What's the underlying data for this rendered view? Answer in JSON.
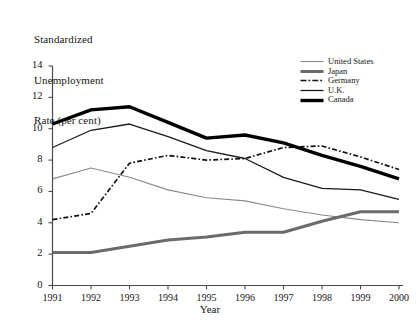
{
  "chart_data": {
    "type": "line",
    "title": "Standardized Unemployment Rate (per cent)",
    "title_lines": [
      "Standardized",
      "Unemployment",
      "Rate (per cent)"
    ],
    "xlabel": "Year",
    "ylabel": "Standardized Unemployment Rate (per cent)",
    "x": [
      1991,
      1992,
      1993,
      1994,
      1995,
      1996,
      1997,
      1998,
      1999,
      2000
    ],
    "categories": [
      "1991",
      "1992",
      "1993",
      "1994",
      "1995",
      "1996",
      "1997",
      "1998",
      "1999",
      "2000"
    ],
    "xlim": [
      1991,
      2000
    ],
    "ylim": [
      0,
      14
    ],
    "yticks": [
      0,
      2,
      4,
      6,
      8,
      10,
      12,
      14
    ],
    "ytick_labels": [
      "0",
      "2",
      "4",
      "6",
      "8",
      "10",
      "12",
      "14"
    ],
    "grid": false,
    "legend_position": "top-right",
    "series": [
      {
        "name": "United States",
        "values": [
          6.8,
          7.5,
          6.9,
          6.1,
          5.6,
          5.4,
          4.9,
          4.5,
          4.2,
          4.0
        ],
        "color": "#8a8a8a",
        "width": 1.1,
        "style": "solid"
      },
      {
        "name": "Japan",
        "values": [
          2.1,
          2.1,
          2.5,
          2.9,
          3.1,
          3.4,
          3.4,
          4.1,
          4.7,
          4.7
        ],
        "color": "#6b6b6b",
        "width": 3.0,
        "style": "solid"
      },
      {
        "name": "Germany",
        "values": [
          4.2,
          4.6,
          7.8,
          8.3,
          8.0,
          8.1,
          8.8,
          8.9,
          8.2,
          7.4
        ],
        "color": "#111111",
        "width": 1.7,
        "style": "dashdot"
      },
      {
        "name": "U.K.",
        "values": [
          8.8,
          9.9,
          10.3,
          9.5,
          8.6,
          8.1,
          6.9,
          6.2,
          6.1,
          5.5
        ],
        "color": "#1a1a1a",
        "width": 1.3,
        "style": "solid"
      },
      {
        "name": "Canada",
        "values": [
          10.3,
          11.2,
          11.4,
          10.4,
          9.4,
          9.6,
          9.1,
          8.3,
          7.6,
          6.8
        ],
        "color": "#000000",
        "width": 3.4,
        "style": "solid"
      }
    ]
  },
  "legend": {
    "entries": [
      {
        "label": "United States"
      },
      {
        "label": "Japan"
      },
      {
        "label": "Germany"
      },
      {
        "label": "U.K."
      },
      {
        "label": "Canada"
      }
    ]
  },
  "axes": {
    "y_title_line1": "Standardized",
    "y_title_line2": "Unemployment",
    "y_title_line3": "Rate (per cent)",
    "x_title": "Year"
  }
}
